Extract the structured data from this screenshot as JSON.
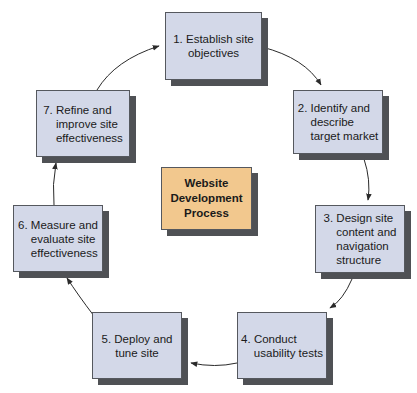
{
  "diagram": {
    "type": "cycle",
    "center": {
      "label": "Website\nDevelopment\nProcess",
      "fill": "#f2c88e"
    },
    "colors": {
      "step_fill": "#d3d8e8",
      "border": "#55585e",
      "shadow": "#4f5155",
      "arrow": "#2a2a2a"
    },
    "steps": [
      {
        "number": 1,
        "label": "1. Establish site\nobjectives"
      },
      {
        "number": 2,
        "label": "2. Identify and\n    describe\n    target market"
      },
      {
        "number": 3,
        "label": "3. Design site\n    content and\n    navigation\n    structure"
      },
      {
        "number": 4,
        "label": "4. Conduct\n    usability tests"
      },
      {
        "number": 5,
        "label": "5. Deploy and\ntune site"
      },
      {
        "number": 6,
        "label": "6. Measure and\n    evaluate site\n    effectiveness"
      },
      {
        "number": 7,
        "label": "7. Refine and\n    improve site\n    effectiveness"
      }
    ],
    "edges": [
      {
        "from": 1,
        "to": 2
      },
      {
        "from": 2,
        "to": 3
      },
      {
        "from": 3,
        "to": 4
      },
      {
        "from": 4,
        "to": 5
      },
      {
        "from": 5,
        "to": 6
      },
      {
        "from": 6,
        "to": 7
      },
      {
        "from": 7,
        "to": 1
      }
    ]
  }
}
